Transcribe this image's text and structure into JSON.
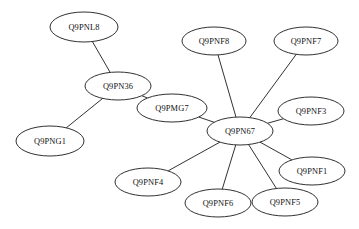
{
  "diagram": {
    "type": "node-link-graph",
    "title": "",
    "background_color": "#ffffff",
    "node_fill_color": "#ffffff",
    "node_stroke_color": "#1a1a1a",
    "edge_color": "#1a1a1a",
    "label_color": "#111111",
    "node_count": 12,
    "edge_count": 11,
    "hub_node": "Q9PN67",
    "nodes": [
      {
        "id": "Q9PNL8",
        "label": "Q9PNL8",
        "cx": 84,
        "cy": 27,
        "rx": 34,
        "ry": 15
      },
      {
        "id": "Q9PN36",
        "label": "Q9PN36",
        "cx": 118,
        "cy": 86,
        "rx": 33,
        "ry": 14
      },
      {
        "id": "Q9PNG1",
        "label": "Q9PNG1",
        "cx": 50,
        "cy": 141,
        "rx": 34,
        "ry": 15
      },
      {
        "id": "Q9PMG7",
        "label": "Q9PMG7",
        "cx": 172,
        "cy": 108,
        "rx": 35,
        "ry": 14
      },
      {
        "id": "Q9PNF8",
        "label": "Q9PNF8",
        "cx": 214,
        "cy": 41,
        "rx": 32,
        "ry": 14
      },
      {
        "id": "Q9PNF7",
        "label": "Q9PNF7",
        "cx": 306,
        "cy": 41,
        "rx": 32,
        "ry": 14
      },
      {
        "id": "Q9PNF3",
        "label": "Q9PNF3",
        "cx": 311,
        "cy": 111,
        "rx": 33,
        "ry": 14
      },
      {
        "id": "Q9PN67",
        "label": "Q9PN67",
        "cx": 240,
        "cy": 131,
        "rx": 33,
        "ry": 14
      },
      {
        "id": "Q9PNF1",
        "label": "Q9PNF1",
        "cx": 312,
        "cy": 171,
        "rx": 33,
        "ry": 14
      },
      {
        "id": "Q9PNF4",
        "label": "Q9PNF4",
        "cx": 148,
        "cy": 182,
        "rx": 33,
        "ry": 14
      },
      {
        "id": "Q9PNF6",
        "label": "Q9PNF6",
        "cx": 218,
        "cy": 203,
        "rx": 33,
        "ry": 14
      },
      {
        "id": "Q9PNF5",
        "label": "Q9PNF5",
        "cx": 285,
        "cy": 202,
        "rx": 33,
        "ry": 14
      }
    ],
    "edges": [
      {
        "source": "Q9PNL8",
        "target": "Q9PN36"
      },
      {
        "source": "Q9PN36",
        "target": "Q9PNG1"
      },
      {
        "source": "Q9PN36",
        "target": "Q9PMG7"
      },
      {
        "source": "Q9PMG7",
        "target": "Q9PN67"
      },
      {
        "source": "Q9PNF8",
        "target": "Q9PN67"
      },
      {
        "source": "Q9PNF7",
        "target": "Q9PN67"
      },
      {
        "source": "Q9PNF3",
        "target": "Q9PN67"
      },
      {
        "source": "Q9PNF1",
        "target": "Q9PN67"
      },
      {
        "source": "Q9PNF5",
        "target": "Q9PN67"
      },
      {
        "source": "Q9PNF6",
        "target": "Q9PN67"
      },
      {
        "source": "Q9PNF4",
        "target": "Q9PN67"
      }
    ]
  }
}
